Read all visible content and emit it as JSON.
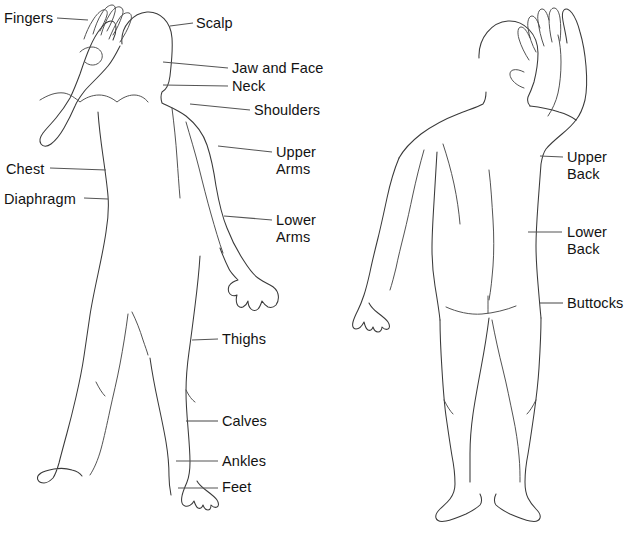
{
  "diagram": {
    "stroke_color": "#3a3a3a",
    "leader_color": "#555555",
    "text_color": "#131313",
    "background": "#ffffff",
    "width": 629,
    "height": 537
  },
  "front_view": {
    "name": "front-facing figure with raised right arm",
    "labels": {
      "fingers": "Fingers",
      "scalp": "Scalp",
      "jaw_and_face": "Jaw and Face",
      "neck": "Neck",
      "shoulders": "Shoulders",
      "upper_arms_line1": "Upper",
      "upper_arms_line2": "Arms",
      "chest": "Chest",
      "diaphragm": "Diaphragm",
      "lower_arms_line1": "Lower",
      "lower_arms_line2": "Arms",
      "thighs": "Thighs",
      "calves": "Calves",
      "ankles": "Ankles",
      "feet": "Feet"
    }
  },
  "back_view": {
    "name": "rear-facing figure with raised left arm",
    "labels": {
      "upper_back_line1": "Upper",
      "upper_back_line2": "Back",
      "lower_back_line1": "Lower",
      "lower_back_line2": "Back",
      "buttocks": "Buttocks"
    }
  }
}
